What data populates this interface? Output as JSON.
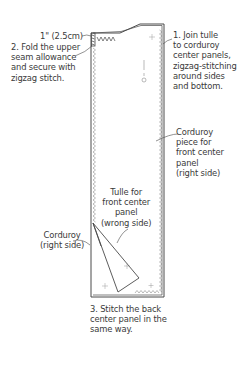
{
  "diagram": {
    "labels": {
      "measure": "1\" (2.5cm)",
      "step2": "2. Fold the upper\nseam allowance\nand secure with\nzigzag stitch.",
      "step1": "1. Join tulle\nto corduroy\ncenter panels,\nzigzag-stitching\naround sides\nand bottom.",
      "corduroy_front": "Corduroy\npiece for\nfront center\npanel\n(right side)",
      "tulle_front": "Tulle for\nfront center\npanel\n(wrong side)",
      "corduroy_right": "Corduroy\n(right side)",
      "step3": "3. Stitch the back\ncenter panel in the\nsame way."
    },
    "colors": {
      "line": "#4a4a4a",
      "text": "#3a3a3a",
      "stitch": "#8a8a8a",
      "background": "#ffffff"
    }
  }
}
